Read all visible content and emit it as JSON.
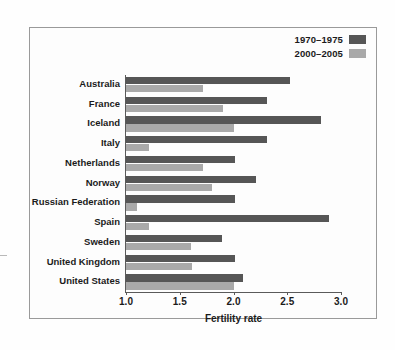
{
  "chart_data": {
    "type": "bar",
    "orientation": "horizontal",
    "title": "",
    "xlabel": "Fertility rate",
    "ylabel": "",
    "xlim": [
      1.0,
      3.0
    ],
    "xticks": [
      "1.0",
      "1.5",
      "2.0",
      "2.5",
      "3.0"
    ],
    "grid": false,
    "legend_position": "top-right",
    "categories": [
      "Australia",
      "France",
      "Iceland",
      "Italy",
      "Netherlands",
      "Norway",
      "Russian Federation",
      "Spain",
      "Sweden",
      "United Kingdom",
      "United States"
    ],
    "series": [
      {
        "name": "1970–1975",
        "color": "#565656",
        "values": [
          2.53,
          2.31,
          2.81,
          2.31,
          2.01,
          2.21,
          2.01,
          2.89,
          1.89,
          2.01,
          2.09
        ]
      },
      {
        "name": "2000–2005",
        "color": "#a9a9a9",
        "values": [
          1.72,
          1.9,
          2.0,
          1.21,
          1.72,
          1.8,
          1.1,
          1.21,
          1.6,
          1.61,
          2.0
        ]
      }
    ]
  },
  "legend": {
    "items": [
      {
        "label": "1970–1975",
        "color": "#565656"
      },
      {
        "label": "2000–2005",
        "color": "#a9a9a9"
      }
    ]
  },
  "axis": {
    "x_title": "Fertility rate",
    "ticks": [
      "1.0",
      "1.5",
      "2.0",
      "2.5",
      "3.0"
    ]
  }
}
